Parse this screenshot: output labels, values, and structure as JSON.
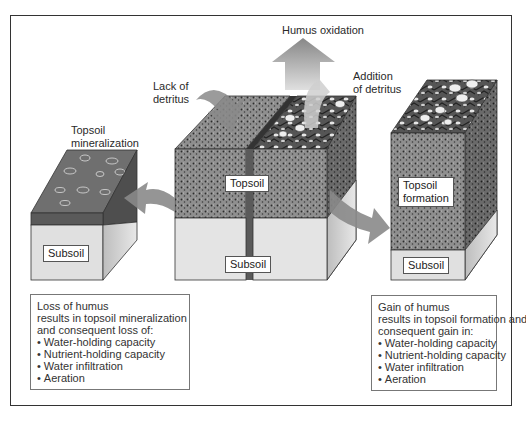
{
  "diagram": {
    "title": "",
    "labels": {
      "humus_oxidation": "Humus oxidation",
      "lack_of_detritus": [
        "Lack of",
        "detritus"
      ],
      "addition_of_detritus": [
        "Addition",
        "of detritus"
      ],
      "topsoil_mineralization": [
        "Topsoil",
        "mineralization"
      ]
    },
    "blocks": {
      "left": {
        "subsoil_tag": "Subsoil"
      },
      "center": {
        "topsoil_tag": "Topsoil",
        "subsoil_tag": "Subsoil"
      },
      "right": {
        "topsoil_tag": [
          "Topsoil",
          "formation"
        ],
        "subsoil_tag": "Subsoil"
      }
    },
    "boxes": {
      "loss": {
        "lines": [
          "Loss of humus",
          "results in topsoil mineralization",
          "and consequent loss of:"
        ],
        "bullets": [
          "Water-holding capacity",
          "Nutrient-holding capacity",
          "Water infiltration",
          "Aeration"
        ]
      },
      "gain": {
        "lines": [
          "Gain of humus",
          "results in topsoil formation and",
          "consequent gain in:"
        ],
        "bullets": [
          "Water-holding capacity",
          "Nutrient-holding capacity",
          "Water infiltration",
          "Aeration"
        ]
      }
    },
    "colors": {
      "frame": "#333333",
      "topsoil": "#8a8a8a",
      "topsoil_dark": "#5e5e5e",
      "subsoil": "#e2e2e2",
      "subsoil_side": "#c8c8c8",
      "arrow": "#8c8c8c"
    }
  }
}
